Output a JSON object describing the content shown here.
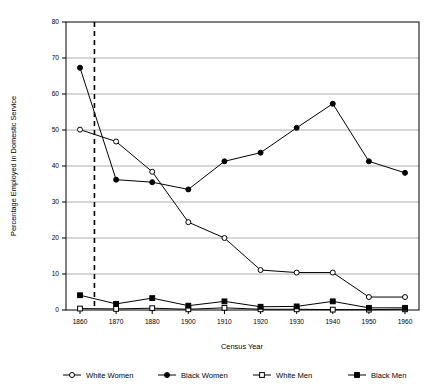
{
  "chart_data": {
    "type": "line",
    "title": "",
    "xlabel": "Census Year",
    "ylabel": "Percentage Employed in Domestic Service",
    "categories": [
      "1860",
      "1870",
      "1880",
      "1900",
      "1910",
      "1920",
      "1930",
      "1940",
      "1950",
      "1960"
    ],
    "xlim": [
      0,
      9
    ],
    "ylim": [
      0,
      80
    ],
    "yticks": [
      0,
      10,
      20,
      30,
      40,
      50,
      60,
      70,
      80
    ],
    "ytick_labels": [
      "0",
      "10",
      "20",
      "30",
      "40",
      "50",
      "60",
      "70",
      "80"
    ],
    "grid": "horizontal",
    "legend_position": "bottom",
    "series": [
      {
        "name": "White Women",
        "marker": "open-circle",
        "color": "#000000",
        "values": [
          50.1,
          46.8,
          38.4,
          24.4,
          20.0,
          11.1,
          10.4,
          10.4,
          3.6,
          3.6
        ]
      },
      {
        "name": "Black Women",
        "marker": "filled-circle",
        "color": "#000000",
        "values": [
          67.3,
          36.2,
          35.5,
          33.5,
          41.3,
          43.7,
          50.6,
          57.3,
          41.3,
          38.1
        ]
      },
      {
        "name": "White Men",
        "marker": "open-square",
        "color": "#000000",
        "values": [
          0.4,
          0.3,
          0.5,
          0.2,
          0.6,
          0.2,
          0.2,
          0.1,
          0.1,
          0.2
        ]
      },
      {
        "name": "Black Men",
        "marker": "filled-square",
        "color": "#000000",
        "values": [
          4.1,
          1.7,
          3.3,
          1.2,
          2.4,
          0.9,
          1.0,
          2.4,
          0.6,
          0.6
        ]
      }
    ],
    "annotations": [
      {
        "name": "emancipation-marker",
        "type": "vertical-dashed-line",
        "x_position": 0.4,
        "label": ""
      }
    ]
  }
}
